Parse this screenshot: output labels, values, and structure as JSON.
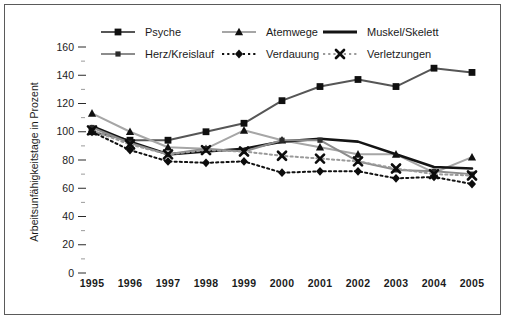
{
  "figure": {
    "border_color": "#5a5a5a",
    "background": "#ffffff"
  },
  "axes": {
    "ylabel": "Arbeitsunfähigkeitstage in Prozent",
    "xlabel": "",
    "yticks": [
      "0",
      "20",
      "40",
      "60",
      "80",
      "100",
      "120",
      "140",
      "160"
    ],
    "xticks": [
      "1995",
      "1996",
      "1997",
      "1998",
      "1999",
      "2000",
      "2001",
      "2002",
      "2003",
      "2004",
      "2005"
    ]
  },
  "legend": {
    "entries": [
      {
        "label": "Psyche",
        "marker": "square",
        "color": "#565656",
        "dash": "solid"
      },
      {
        "label": "Atemwege",
        "marker": "triangle",
        "color": "#a6a6a6",
        "dash": "solid"
      },
      {
        "label": "Muskel/Skelett",
        "marker": "none",
        "color": "#141414",
        "dash": "solid"
      },
      {
        "label": "Herz/Kreislauf",
        "marker": "small-square",
        "color": "#8c8c8c",
        "dash": "solid"
      },
      {
        "label": "Verdauung",
        "marker": "diamond",
        "color": "#111111",
        "dash": "dotted"
      },
      {
        "label": "Verletzungen",
        "marker": "cross",
        "color": "#9a9a9a",
        "dash": "dotted"
      }
    ]
  },
  "chart_data": {
    "type": "line",
    "title": "",
    "xlabel": "",
    "ylabel": "Arbeitsunfähigkeitstage in Prozent",
    "categories": [
      "1995",
      "1996",
      "1997",
      "1998",
      "1999",
      "2000",
      "2001",
      "2002",
      "2003",
      "2004",
      "2005"
    ],
    "ylim": [
      0,
      160
    ],
    "ytick_step": 20,
    "grid": false,
    "legend_position": "top-inside",
    "series": [
      {
        "name": "Psyche",
        "color": "#565656",
        "marker": "square",
        "dash": "solid",
        "values": [
          100,
          94,
          94,
          100,
          106,
          122,
          132,
          137,
          132,
          145,
          142
        ]
      },
      {
        "name": "Atemwege",
        "color": "#a6a6a6",
        "marker": "triangle",
        "dash": "solid",
        "values": [
          113,
          100,
          89,
          88,
          101,
          94,
          89,
          84,
          84,
          71,
          82
        ]
      },
      {
        "name": "Muskel/Skelett",
        "color": "#141414",
        "marker": "none",
        "dash": "solid",
        "values": [
          104,
          93,
          84,
          86,
          88,
          93,
          95,
          93,
          84,
          75,
          74
        ]
      },
      {
        "name": "Herz/Kreislauf",
        "color": "#8c8c8c",
        "marker": "small-square",
        "dash": "solid",
        "values": [
          103,
          92,
          84,
          88,
          86,
          94,
          94,
          79,
          73,
          72,
          70
        ]
      },
      {
        "name": "Verdauung",
        "color": "#111111",
        "marker": "diamond",
        "dash": "dotted",
        "values": [
          100,
          87,
          79,
          78,
          79,
          71,
          72,
          72,
          67,
          68,
          63
        ]
      },
      {
        "name": "Verletzungen",
        "color": "#9a9a9a",
        "marker": "cross",
        "dash": "dotted",
        "values": [
          101,
          91,
          84,
          87,
          86,
          83,
          81,
          79,
          74,
          70,
          69
        ]
      }
    ]
  }
}
